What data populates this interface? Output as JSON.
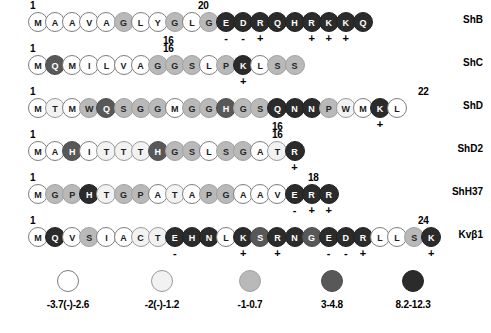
{
  "figure": {
    "bead_shades": {
      "s0": "#ffffff",
      "s1": "#f2f2f2",
      "s2": "#b9b9b9",
      "s3": "#585858",
      "s4": "#2b2b2b"
    }
  },
  "rows": [
    {
      "name": "ShB",
      "start_label": "1",
      "end_label": "20",
      "end_label_x": 198,
      "mid_label": "16",
      "mid_label_x": 163,
      "residues": [
        {
          "aa": "M",
          "shade": "s0",
          "charge": ""
        },
        {
          "aa": "A",
          "shade": "s0",
          "charge": ""
        },
        {
          "aa": "A",
          "shade": "s0",
          "charge": ""
        },
        {
          "aa": "V",
          "shade": "s0",
          "charge": ""
        },
        {
          "aa": "A",
          "shade": "s0",
          "charge": ""
        },
        {
          "aa": "G",
          "shade": "s2",
          "charge": ""
        },
        {
          "aa": "L",
          "shade": "s0",
          "charge": ""
        },
        {
          "aa": "Y",
          "shade": "s0",
          "charge": ""
        },
        {
          "aa": "G",
          "shade": "s2",
          "charge": ""
        },
        {
          "aa": "L",
          "shade": "s0",
          "charge": ""
        },
        {
          "aa": "G",
          "shade": "s2",
          "charge": ""
        },
        {
          "aa": "E",
          "shade": "s4",
          "charge": "-"
        },
        {
          "aa": "D",
          "shade": "s4",
          "charge": "-"
        },
        {
          "aa": "R",
          "shade": "s4",
          "charge": "+"
        },
        {
          "aa": "Q",
          "shade": "s4",
          "charge": ""
        },
        {
          "aa": "H",
          "shade": "s4",
          "charge": ""
        },
        {
          "aa": "R",
          "shade": "s4",
          "charge": "+"
        },
        {
          "aa": "K",
          "shade": "s4",
          "charge": "+"
        },
        {
          "aa": "K",
          "shade": "s4",
          "charge": "+"
        },
        {
          "aa": "Q",
          "shade": "s4",
          "charge": ""
        }
      ]
    },
    {
      "name": "ShC",
      "start_label": "1",
      "end_label": "16",
      "end_label_x": 163,
      "mid_label": "",
      "mid_label_x": 0,
      "residues": [
        {
          "aa": "M",
          "shade": "s0",
          "charge": ""
        },
        {
          "aa": "Q",
          "shade": "s3",
          "charge": ""
        },
        {
          "aa": "M",
          "shade": "s0",
          "charge": ""
        },
        {
          "aa": "I",
          "shade": "s0",
          "charge": ""
        },
        {
          "aa": "L",
          "shade": "s0",
          "charge": ""
        },
        {
          "aa": "V",
          "shade": "s0",
          "charge": ""
        },
        {
          "aa": "A",
          "shade": "s0",
          "charge": ""
        },
        {
          "aa": "G",
          "shade": "s2",
          "charge": ""
        },
        {
          "aa": "G",
          "shade": "s2",
          "charge": ""
        },
        {
          "aa": "S",
          "shade": "s2",
          "charge": ""
        },
        {
          "aa": "L",
          "shade": "s0",
          "charge": ""
        },
        {
          "aa": "P",
          "shade": "s2",
          "charge": ""
        },
        {
          "aa": "K",
          "shade": "s4",
          "charge": "+"
        },
        {
          "aa": "L",
          "shade": "s0",
          "charge": ""
        },
        {
          "aa": "S",
          "shade": "s2",
          "charge": ""
        },
        {
          "aa": "S",
          "shade": "s2",
          "charge": ""
        }
      ]
    },
    {
      "name": "ShD",
      "start_label": "1",
      "end_label": "22",
      "end_label_x": 418,
      "mid_label": "16",
      "mid_label_x": 272,
      "residues": [
        {
          "aa": "M",
          "shade": "s0",
          "charge": ""
        },
        {
          "aa": "T",
          "shade": "s1",
          "charge": ""
        },
        {
          "aa": "M",
          "shade": "s0",
          "charge": ""
        },
        {
          "aa": "W",
          "shade": "s2",
          "charge": ""
        },
        {
          "aa": "Q",
          "shade": "s3",
          "charge": ""
        },
        {
          "aa": "S",
          "shade": "s2",
          "charge": ""
        },
        {
          "aa": "G",
          "shade": "s2",
          "charge": ""
        },
        {
          "aa": "G",
          "shade": "s2",
          "charge": ""
        },
        {
          "aa": "M",
          "shade": "s0",
          "charge": ""
        },
        {
          "aa": "G",
          "shade": "s2",
          "charge": ""
        },
        {
          "aa": "G",
          "shade": "s2",
          "charge": ""
        },
        {
          "aa": "H",
          "shade": "s3",
          "charge": ""
        },
        {
          "aa": "G",
          "shade": "s2",
          "charge": ""
        },
        {
          "aa": "S",
          "shade": "s2",
          "charge": ""
        },
        {
          "aa": "Q",
          "shade": "s4",
          "charge": ""
        },
        {
          "aa": "N",
          "shade": "s4",
          "charge": ""
        },
        {
          "aa": "N",
          "shade": "s4",
          "charge": ""
        },
        {
          "aa": "P",
          "shade": "s2",
          "charge": ""
        },
        {
          "aa": "W",
          "shade": "s1",
          "charge": ""
        },
        {
          "aa": "M",
          "shade": "s0",
          "charge": ""
        },
        {
          "aa": "K",
          "shade": "s4",
          "charge": "+"
        },
        {
          "aa": "L",
          "shade": "s0",
          "charge": ""
        }
      ]
    },
    {
      "name": "ShD2",
      "start_label": "1",
      "end_label": "16",
      "end_label_x": 272,
      "mid_label": "",
      "mid_label_x": 0,
      "residues": [
        {
          "aa": "M",
          "shade": "s0",
          "charge": ""
        },
        {
          "aa": "A",
          "shade": "s0",
          "charge": ""
        },
        {
          "aa": "H",
          "shade": "s3",
          "charge": ""
        },
        {
          "aa": "I",
          "shade": "s0",
          "charge": ""
        },
        {
          "aa": "T",
          "shade": "s1",
          "charge": ""
        },
        {
          "aa": "T",
          "shade": "s1",
          "charge": ""
        },
        {
          "aa": "T",
          "shade": "s1",
          "charge": ""
        },
        {
          "aa": "H",
          "shade": "s3",
          "charge": ""
        },
        {
          "aa": "G",
          "shade": "s2",
          "charge": ""
        },
        {
          "aa": "S",
          "shade": "s2",
          "charge": ""
        },
        {
          "aa": "L",
          "shade": "s0",
          "charge": ""
        },
        {
          "aa": "S",
          "shade": "s2",
          "charge": ""
        },
        {
          "aa": "G",
          "shade": "s2",
          "charge": ""
        },
        {
          "aa": "A",
          "shade": "s0",
          "charge": ""
        },
        {
          "aa": "T",
          "shade": "s1",
          "charge": ""
        },
        {
          "aa": "R",
          "shade": "s4",
          "charge": "+"
        }
      ]
    },
    {
      "name": "ShH37",
      "start_label": "1",
      "end_label": "18",
      "end_label_x": 308,
      "mid_label": "",
      "mid_label_x": 0,
      "residues": [
        {
          "aa": "M",
          "shade": "s0",
          "charge": ""
        },
        {
          "aa": "G",
          "shade": "s2",
          "charge": ""
        },
        {
          "aa": "P",
          "shade": "s2",
          "charge": ""
        },
        {
          "aa": "H",
          "shade": "s4",
          "charge": ""
        },
        {
          "aa": "T",
          "shade": "s1",
          "charge": ""
        },
        {
          "aa": "G",
          "shade": "s2",
          "charge": ""
        },
        {
          "aa": "P",
          "shade": "s2",
          "charge": ""
        },
        {
          "aa": "A",
          "shade": "s0",
          "charge": ""
        },
        {
          "aa": "T",
          "shade": "s1",
          "charge": ""
        },
        {
          "aa": "A",
          "shade": "s0",
          "charge": ""
        },
        {
          "aa": "P",
          "shade": "s2",
          "charge": ""
        },
        {
          "aa": "G",
          "shade": "s2",
          "charge": ""
        },
        {
          "aa": "A",
          "shade": "s0",
          "charge": ""
        },
        {
          "aa": "A",
          "shade": "s0",
          "charge": ""
        },
        {
          "aa": "V",
          "shade": "s0",
          "charge": ""
        },
        {
          "aa": "E",
          "shade": "s4",
          "charge": "-"
        },
        {
          "aa": "R",
          "shade": "s4",
          "charge": "+"
        },
        {
          "aa": "R",
          "shade": "s4",
          "charge": "+"
        }
      ]
    },
    {
      "name": "Kvβ1",
      "start_label": "1",
      "end_label": "24",
      "end_label_x": 418,
      "mid_label": "",
      "mid_label_x": 0,
      "residues": [
        {
          "aa": "M",
          "shade": "s0",
          "charge": ""
        },
        {
          "aa": "Q",
          "shade": "s4",
          "charge": ""
        },
        {
          "aa": "V",
          "shade": "s0",
          "charge": ""
        },
        {
          "aa": "S",
          "shade": "s2",
          "charge": ""
        },
        {
          "aa": "I",
          "shade": "s0",
          "charge": ""
        },
        {
          "aa": "A",
          "shade": "s0",
          "charge": ""
        },
        {
          "aa": "C",
          "shade": "s1",
          "charge": ""
        },
        {
          "aa": "T",
          "shade": "s1",
          "charge": ""
        },
        {
          "aa": "E",
          "shade": "s4",
          "charge": "-"
        },
        {
          "aa": "H",
          "shade": "s4",
          "charge": ""
        },
        {
          "aa": "N",
          "shade": "s4",
          "charge": ""
        },
        {
          "aa": "L",
          "shade": "s0",
          "charge": ""
        },
        {
          "aa": "K",
          "shade": "s4",
          "charge": "+"
        },
        {
          "aa": "S",
          "shade": "s3",
          "charge": ""
        },
        {
          "aa": "R",
          "shade": "s4",
          "charge": "+"
        },
        {
          "aa": "N",
          "shade": "s4",
          "charge": ""
        },
        {
          "aa": "G",
          "shade": "s3",
          "charge": ""
        },
        {
          "aa": "E",
          "shade": "s4",
          "charge": "-"
        },
        {
          "aa": "D",
          "shade": "s4",
          "charge": "-"
        },
        {
          "aa": "R",
          "shade": "s4",
          "charge": "+"
        },
        {
          "aa": "L",
          "shade": "s0",
          "charge": ""
        },
        {
          "aa": "L",
          "shade": "s0",
          "charge": ""
        },
        {
          "aa": "S",
          "shade": "s2",
          "charge": ""
        },
        {
          "aa": "K",
          "shade": "s4",
          "charge": "+"
        }
      ]
    }
  ],
  "legend": {
    "items": [
      {
        "label": "-3.7(-)-2.6",
        "shade": "s0",
        "x": 18
      },
      {
        "label": "-2(-)-1.2",
        "shade": "s1",
        "x": 112
      },
      {
        "label": "-1-0.7",
        "shade": "s2",
        "x": 200
      },
      {
        "label": "3-4.8",
        "shade": "s3",
        "x": 282
      },
      {
        "label": "8.2-12.3",
        "shade": "s4",
        "x": 363
      }
    ]
  }
}
